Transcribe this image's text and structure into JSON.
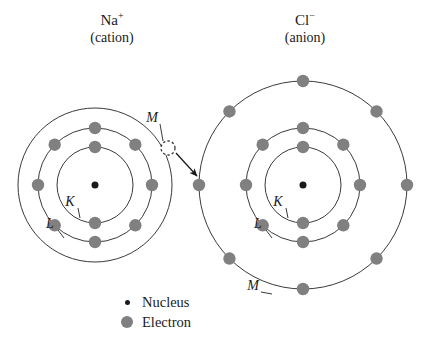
{
  "diagram": {
    "type": "ion-electron-shell-diagram",
    "background_color": "#ffffff",
    "stroke_color": "#3a3a3a",
    "electron_color": "#808080",
    "nucleus_color": "#1a1a1a",
    "text_color": "#1a1a1a"
  },
  "ions": [
    {
      "id": "sodium-cation",
      "symbol": "Na",
      "charge": "+",
      "charge_name": "(cation)",
      "center": {
        "x": 95,
        "y": 185
      },
      "nucleus_radius": 3.5,
      "shells": [
        {
          "label": "K",
          "radius": 38,
          "electron_count": 2,
          "electron_angles": [
            0,
            180
          ]
        },
        {
          "label": "L",
          "radius": 57,
          "electron_count": 8,
          "electron_angles": [
            0,
            45,
            90,
            135,
            180,
            225,
            270,
            315
          ]
        },
        {
          "label": "M",
          "radius": 77,
          "electron_count": 0,
          "electron_angles": []
        }
      ],
      "shell_label_positions": [
        {
          "label": "K",
          "x": 70,
          "y": 206,
          "leader_to": {
            "x": 80,
            "y": 218
          }
        },
        {
          "label": "L",
          "x": 50,
          "y": 228,
          "leader_to": {
            "x": 64,
            "y": 238
          }
        },
        {
          "label": "M",
          "x": 152,
          "y": 122,
          "leader_to": {
            "x": 163,
            "y": 141
          }
        }
      ],
      "vacancy": {
        "present": true,
        "x": 168,
        "y": 148,
        "radius": 7,
        "style": "dashed-empty-circle"
      }
    },
    {
      "id": "chloride-anion",
      "symbol": "Cl",
      "charge": "−",
      "charge_name": "(anion)",
      "center": {
        "x": 303,
        "y": 185
      },
      "nucleus_radius": 3.5,
      "shells": [
        {
          "label": "K",
          "radius": 38,
          "electron_count": 2,
          "electron_angles": [
            0,
            180
          ]
        },
        {
          "label": "L",
          "radius": 57,
          "electron_count": 8,
          "electron_angles": [
            0,
            45,
            90,
            135,
            180,
            225,
            270,
            315
          ]
        },
        {
          "label": "M",
          "radius": 104,
          "electron_count": 8,
          "electron_angles": [
            0,
            45,
            90,
            135,
            180,
            225,
            270,
            315
          ]
        }
      ],
      "shell_label_positions": [
        {
          "label": "K",
          "x": 278,
          "y": 206,
          "leader_to": {
            "x": 288,
            "y": 218
          }
        },
        {
          "label": "L",
          "x": 258,
          "y": 228,
          "leader_to": {
            "x": 272,
            "y": 238
          }
        },
        {
          "label": "M",
          "x": 253,
          "y": 290,
          "leader_to": {
            "x": 272,
            "y": 294
          }
        }
      ],
      "vacancy": {
        "present": false
      }
    }
  ],
  "transfer_arrow": {
    "label": "electron-transfer",
    "from": {
      "x": 176,
      "y": 153
    },
    "to": {
      "x": 197,
      "y": 176
    }
  },
  "legend": {
    "items": [
      {
        "marker": "nucleus-dot",
        "label": "Nucleus"
      },
      {
        "marker": "electron-dot",
        "label": "Electron"
      }
    ]
  }
}
